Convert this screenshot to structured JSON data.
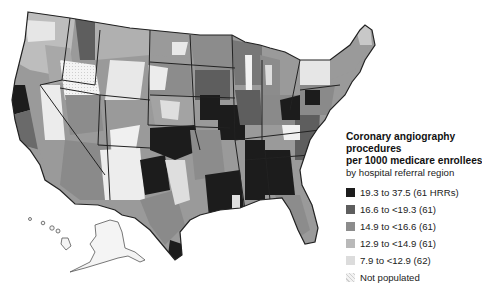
{
  "legend": {
    "title_lines": [
      "Coronary angiography",
      "procedures",
      "per 1000 medicare enrollees"
    ],
    "subtitle": "by hospital referral region",
    "items": [
      {
        "label": "19.3 to 37.5 (61 HRRs)",
        "color": "#1c1c1c"
      },
      {
        "label": "16.6 to <19.3 (61)",
        "color": "#5e5e5e"
      },
      {
        "label": "14.9 to <16.6 (61)",
        "color": "#8c8c8c"
      },
      {
        "label": "12.9 to <14.9 (61)",
        "color": "#b9b9b9"
      },
      {
        "label": "7.9 to <12.9 (62)",
        "color": "#dcdcdc"
      },
      {
        "label": "Not populated",
        "color": "#f2f2f2"
      }
    ]
  },
  "map": {
    "subject": "United States hospital referral regions",
    "border_color": "#222222",
    "background": "#ffffff"
  }
}
